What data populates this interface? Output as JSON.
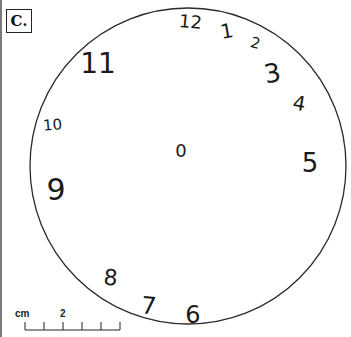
{
  "figure": {
    "panel_label": "C."
  },
  "clock": {
    "circle": {
      "cx": 188,
      "cy": 166,
      "r": 158,
      "stroke": "#2a2a2a"
    },
    "center_mark": "0",
    "numerals": [
      {
        "label": "12",
        "x": 190,
        "y": 28,
        "size": 18,
        "rotate": 5
      },
      {
        "label": "1",
        "x": 228,
        "y": 38,
        "size": 20,
        "rotate": -10
      },
      {
        "label": "2",
        "x": 254,
        "y": 48,
        "size": 15,
        "rotate": 15
      },
      {
        "label": "3",
        "x": 274,
        "y": 82,
        "size": 26,
        "rotate": -10
      },
      {
        "label": "4",
        "x": 298,
        "y": 110,
        "size": 20,
        "rotate": 10
      },
      {
        "label": "5",
        "x": 310,
        "y": 172,
        "size": 26,
        "rotate": 0
      },
      {
        "label": "6",
        "x": 193,
        "y": 323,
        "size": 24,
        "rotate": 0
      },
      {
        "label": "7",
        "x": 148,
        "y": 314,
        "size": 24,
        "rotate": 5
      },
      {
        "label": "8",
        "x": 110,
        "y": 285,
        "size": 22,
        "rotate": 5
      },
      {
        "label": "9",
        "x": 56,
        "y": 200,
        "size": 30,
        "rotate": 0
      },
      {
        "label": "10",
        "x": 53,
        "y": 130,
        "size": 15,
        "rotate": -5
      },
      {
        "label": "11",
        "x": 98,
        "y": 73,
        "size": 28,
        "rotate": 0
      }
    ],
    "center": {
      "label": "0",
      "x": 181,
      "y": 157,
      "size": 18
    }
  },
  "scale_bar": {
    "unit_label": "cm",
    "tick_label": "2",
    "ticks_x": [
      25,
      44,
      63,
      82,
      101,
      120
    ],
    "baseline_y": 330,
    "tick_top_y": 322
  }
}
